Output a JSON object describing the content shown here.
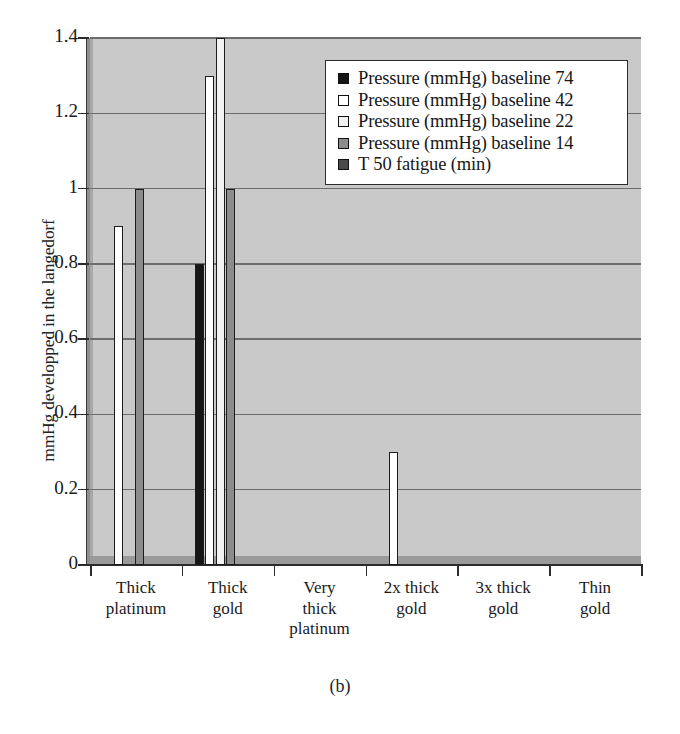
{
  "caption": "(b)",
  "chart_data": {
    "type": "bar",
    "title": "",
    "subtitle": "",
    "xlabel": "",
    "ylabel": "mmHg developped in the langedorf",
    "ylim": [
      0,
      1.4
    ],
    "yticks": [
      "0",
      "0.2",
      "0.4",
      "0.6",
      "0.8",
      "1",
      "1.2",
      "1.4"
    ],
    "ytick_values": [
      0,
      0.2,
      0.4,
      0.6,
      0.8,
      1,
      1.2,
      1.4
    ],
    "grid": true,
    "grid_axis": "y",
    "legend_position": "upper right",
    "categories": [
      "Thick platinum",
      "Thick gold",
      "Very thick platinum",
      "2x thick gold",
      "3x thick gold",
      "Thin gold"
    ],
    "category_lines": [
      [
        "Thick",
        "platinum"
      ],
      [
        "Thick",
        "gold"
      ],
      [
        "Very",
        "thick",
        "platinum"
      ],
      [
        "2x thick",
        "gold"
      ],
      [
        "3x thick",
        "gold"
      ],
      [
        "Thin",
        "gold"
      ]
    ],
    "series": [
      {
        "name": "Pressure (mmHg) baseline 74",
        "color": "#161616",
        "values": [
          0,
          0.8,
          0,
          0,
          0,
          0
        ]
      },
      {
        "name": "Pressure (mmHg) baseline 42",
        "color": "#ffffff",
        "values": [
          0.9,
          1.3,
          0,
          0.3,
          0,
          0
        ]
      },
      {
        "name": "Pressure (mmHg) baseline 22",
        "color": "#f2f2f2",
        "values": [
          0,
          1.4,
          0,
          0,
          0,
          0
        ]
      },
      {
        "name": "Pressure (mmHg) baseline 14",
        "color": "#8c8c8c",
        "values": [
          1.0,
          1.0,
          0,
          0,
          0,
          0
        ]
      },
      {
        "name": "T 50 fatigue (min)",
        "color": "#4a4a4a",
        "values": [
          0,
          0,
          0,
          0,
          0,
          0
        ]
      }
    ]
  },
  "legend": {
    "items": [
      {
        "label": "Pressure (mmHg) baseline 74",
        "swatch": "#161616"
      },
      {
        "label": "Pressure (mmHg) baseline 42",
        "swatch": "#ffffff"
      },
      {
        "label": "Pressure (mmHg) baseline 22",
        "swatch": "#f2f2f2"
      },
      {
        "label": "Pressure (mmHg) baseline 14",
        "swatch": "#8c8c8c"
      },
      {
        "label": "T 50 fatigue (min)",
        "swatch": "#4a4a4a"
      }
    ]
  },
  "colors": {
    "plot_background": "#c9c9c9",
    "gridline": "#6d6d6d",
    "axis": "#2b2b2b",
    "bar_outline": "#1c1c1c",
    "page_background": "#ffffff"
  }
}
